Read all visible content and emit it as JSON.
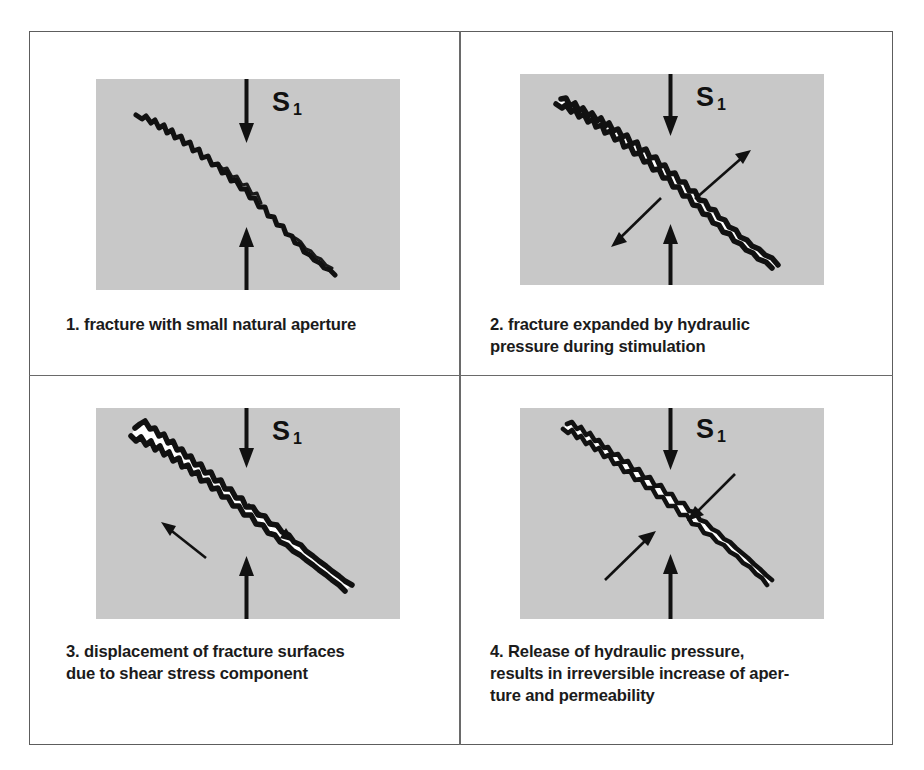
{
  "figure": {
    "frame_color": "#5d5d5d",
    "illustration_background": "#c8c8c8",
    "ink_color": "#111111",
    "aperture_fill": "#ffffff",
    "page_background": "#ffffff"
  },
  "stress_label": {
    "symbol": "S",
    "subscript": "1",
    "meaning": "maximum principal stress"
  },
  "panels": [
    {
      "number": "1.",
      "caption": "1. fracture with small natural aperture",
      "state": "closed",
      "arrows": {
        "vertical_stress": [
          "down-from-top",
          "up-from-bottom"
        ],
        "secondary": []
      }
    },
    {
      "number": "2.",
      "caption": "2. fracture expanded by hydraulic\npressure during stimulation",
      "state": "open-dilated",
      "arrows": {
        "vertical_stress": [
          "down-from-top",
          "up-from-bottom"
        ],
        "secondary": [
          "outward-upper-right",
          "outward-lower-left"
        ]
      }
    },
    {
      "number": "3.",
      "caption": "3. displacement of fracture surfaces\ndue to shear stress component",
      "state": "sheared-open",
      "arrows": {
        "vertical_stress": [
          "down-from-top",
          "up-from-bottom"
        ],
        "secondary": [
          "shear-down-right",
          "shear-up-left"
        ]
      }
    },
    {
      "number": "4.",
      "caption": "4. Release of hydraulic pressure,\nresults in irreversible increase of aper-\nture and permeability",
      "state": "closed-with-residual-aperture",
      "arrows": {
        "vertical_stress": [
          "down-from-top",
          "up-from-bottom"
        ],
        "secondary": [
          "inward-from-upper-right",
          "inward-from-lower-left"
        ]
      }
    }
  ]
}
